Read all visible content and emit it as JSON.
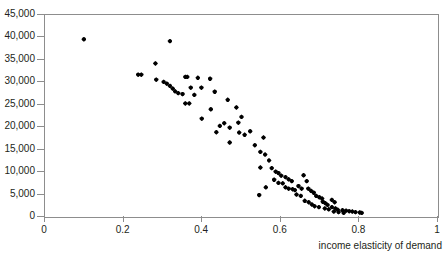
{
  "figure": {
    "cropped_top_text": "",
    "background": "#ffffff",
    "frame_color": "#8d8d8d",
    "point_color": "#000000"
  },
  "chart_data": {
    "type": "scatter",
    "title": "",
    "xlabel": "income elasticity of demand",
    "ylabel": "",
    "xlim": [
      0,
      1
    ],
    "ylim": [
      0,
      45000
    ],
    "xticks": [
      0,
      0.2,
      0.4,
      0.6,
      0.8,
      1
    ],
    "xticklabels": [
      "0",
      "0.2",
      "0.4",
      "0.6",
      "0.8",
      "1"
    ],
    "yticks": [
      0,
      5000,
      10000,
      15000,
      20000,
      25000,
      30000,
      35000,
      40000,
      45000
    ],
    "yticklabels": [
      "0",
      "5,000",
      "10,000",
      "15,000",
      "20,000",
      "25,000",
      "30,000",
      "35,000",
      "40,000",
      "45,000"
    ],
    "grid": false,
    "legend": null,
    "marker": "diamond",
    "points": [
      [
        0.099,
        39600
      ],
      [
        0.318,
        39200
      ],
      [
        0.281,
        34200
      ],
      [
        0.237,
        31700
      ],
      [
        0.245,
        31700
      ],
      [
        0.283,
        30600
      ],
      [
        0.302,
        30100
      ],
      [
        0.31,
        29700
      ],
      [
        0.318,
        29200
      ],
      [
        0.325,
        28600
      ],
      [
        0.331,
        28000
      ],
      [
        0.339,
        27600
      ],
      [
        0.35,
        27400
      ],
      [
        0.357,
        31200
      ],
      [
        0.362,
        31200
      ],
      [
        0.389,
        31000
      ],
      [
        0.371,
        28800
      ],
      [
        0.38,
        27200
      ],
      [
        0.398,
        28800
      ],
      [
        0.357,
        25300
      ],
      [
        0.367,
        25300
      ],
      [
        0.42,
        30800
      ],
      [
        0.432,
        27900
      ],
      [
        0.422,
        24000
      ],
      [
        0.399,
        21900
      ],
      [
        0.465,
        26100
      ],
      [
        0.487,
        24400
      ],
      [
        0.445,
        20300
      ],
      [
        0.436,
        18900
      ],
      [
        0.456,
        20900
      ],
      [
        0.47,
        19900
      ],
      [
        0.492,
        21000
      ],
      [
        0.5,
        22300
      ],
      [
        0.494,
        18800
      ],
      [
        0.508,
        18300
      ],
      [
        0.522,
        19100
      ],
      [
        0.47,
        16600
      ],
      [
        0.534,
        16000
      ],
      [
        0.556,
        17700
      ],
      [
        0.548,
        14500
      ],
      [
        0.56,
        13900
      ],
      [
        0.57,
        12600
      ],
      [
        0.548,
        11000
      ],
      [
        0.577,
        10900
      ],
      [
        0.587,
        10100
      ],
      [
        0.594,
        9800
      ],
      [
        0.601,
        9200
      ],
      [
        0.583,
        8300
      ],
      [
        0.594,
        7600
      ],
      [
        0.605,
        7500
      ],
      [
        0.612,
        8900
      ],
      [
        0.62,
        8400
      ],
      [
        0.628,
        8000
      ],
      [
        0.612,
        6600
      ],
      [
        0.62,
        6300
      ],
      [
        0.63,
        6200
      ],
      [
        0.636,
        6000
      ],
      [
        0.645,
        6900
      ],
      [
        0.653,
        6300
      ],
      [
        0.64,
        5000
      ],
      [
        0.651,
        4700
      ],
      [
        0.562,
        6600
      ],
      [
        0.545,
        4900
      ],
      [
        0.658,
        9300
      ],
      [
        0.666,
        8000
      ],
      [
        0.67,
        6300
      ],
      [
        0.677,
        5800
      ],
      [
        0.684,
        5400
      ],
      [
        0.661,
        3600
      ],
      [
        0.671,
        3300
      ],
      [
        0.679,
        2800
      ],
      [
        0.69,
        4700
      ],
      [
        0.698,
        4400
      ],
      [
        0.705,
        4100
      ],
      [
        0.686,
        2400
      ],
      [
        0.697,
        2200
      ],
      [
        0.707,
        3400
      ],
      [
        0.713,
        3100
      ],
      [
        0.719,
        2700
      ],
      [
        0.712,
        1900
      ],
      [
        0.722,
        1700
      ],
      [
        0.73,
        3800
      ],
      [
        0.737,
        3300
      ],
      [
        0.73,
        2200
      ],
      [
        0.739,
        1900
      ],
      [
        0.745,
        1600
      ],
      [
        0.735,
        1200
      ],
      [
        0.747,
        1100
      ],
      [
        0.757,
        1500
      ],
      [
        0.766,
        1400
      ],
      [
        0.774,
        1300
      ],
      [
        0.76,
        900
      ],
      [
        0.782,
        1200
      ],
      [
        0.79,
        1100
      ],
      [
        0.801,
        1000
      ],
      [
        0.806,
        900
      ]
    ]
  },
  "axes": {
    "x_title": "income elasticity of demand"
  }
}
